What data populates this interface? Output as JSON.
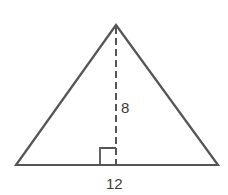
{
  "diagram": {
    "type": "triangle",
    "labels": {
      "height": "8",
      "base": "12"
    },
    "colors": {
      "stroke": "#555555",
      "background": "#ffffff"
    }
  }
}
